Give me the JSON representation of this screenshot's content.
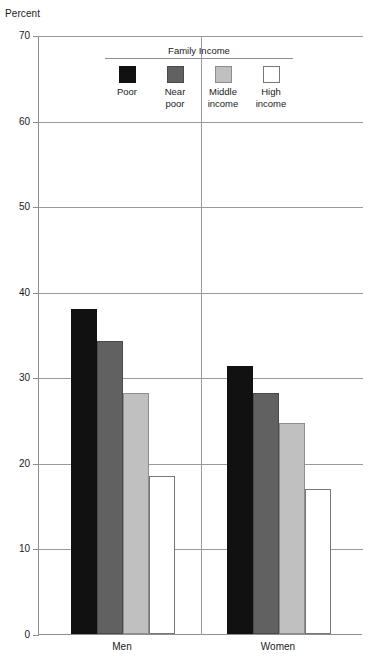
{
  "chart_data": {
    "type": "bar",
    "title": "",
    "xlabel": "",
    "ylabel": "Percent",
    "ylim": [
      0,
      70
    ],
    "yticks": [
      0,
      10,
      20,
      30,
      40,
      50,
      60,
      70
    ],
    "ytick_labels": [
      "0",
      "10",
      "20",
      "30",
      "40",
      "50",
      "60",
      "70"
    ],
    "grid": true,
    "legend_position": "top-center",
    "legend_title": "Family Income",
    "categories": [
      "Men",
      "Women"
    ],
    "series": [
      {
        "name": "Poor",
        "swatch": "swatch-poor",
        "color": "#111111",
        "values": [
          38.0,
          31.3
        ]
      },
      {
        "name": "Near poor",
        "swatch": "swatch-near-poor",
        "color": "#616161",
        "values": [
          34.3,
          28.2
        ]
      },
      {
        "name": "Middle income",
        "swatch": "swatch-middle",
        "color": "#c0c0c0",
        "values": [
          28.2,
          24.7
        ]
      },
      {
        "name": "High income",
        "swatch": "swatch-high",
        "color": "#ffffff",
        "values": [
          18.5,
          17.0
        ]
      }
    ]
  },
  "axis": {
    "y_title": "Percent",
    "y_labels": [
      "70",
      "60",
      "50",
      "40",
      "30",
      "20",
      "10",
      "0"
    ],
    "x_labels": [
      "Men",
      "Women"
    ]
  },
  "legend": {
    "title": "Family Income",
    "items": [
      {
        "label": "Poor",
        "swatch": "swatch-poor"
      },
      {
        "label": "Near\npoor",
        "swatch": "swatch-near-poor"
      },
      {
        "label": "Middle\nincome",
        "swatch": "swatch-middle"
      },
      {
        "label": "High\nincome",
        "swatch": "swatch-high"
      }
    ]
  }
}
